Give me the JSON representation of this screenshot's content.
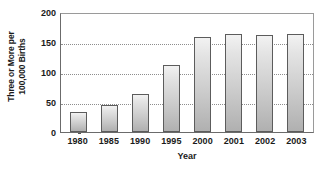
{
  "chart_data": {
    "type": "bar",
    "title": "",
    "xlabel": "Year",
    "ylabel": "Three or More per 100,000 Births",
    "ylabel_lines": [
      "Three or More per",
      "100,000 Births"
    ],
    "categories": [
      "1980",
      "1985",
      "1990",
      "1995",
      "2000",
      "2001",
      "2002",
      "2003"
    ],
    "values": [
      33,
      45,
      63,
      112,
      158,
      163,
      161,
      163
    ],
    "ylim": [
      0,
      200
    ],
    "yticks": [
      0,
      50,
      100,
      150,
      200
    ],
    "ytick_labels": [
      "0",
      "50",
      "100",
      "150",
      "200"
    ],
    "grid": "horizontal-dotted",
    "legend": "none",
    "bar_fill_top": "#f2f2f2",
    "bar_fill_bottom": "#b0b0b0",
    "bar_border": "#5c5c5c",
    "gridline_color": "#8d8d8d",
    "axis_color": "#6b6b6b",
    "background": "#ffffff",
    "text_color": "#1a1a1a"
  }
}
